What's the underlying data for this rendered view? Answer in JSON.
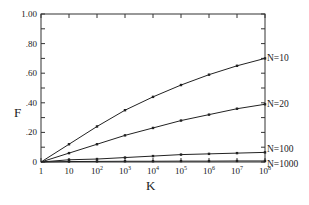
{
  "chart_data": {
    "type": "line",
    "title": "",
    "xlabel": "K",
    "ylabel": "F",
    "x_scale": "log",
    "x": [
      1,
      10,
      100,
      1000,
      10000,
      100000,
      1000000,
      10000000,
      100000000
    ],
    "x_tick_labels": [
      {
        "base": "1",
        "exp": ""
      },
      {
        "base": "10",
        "exp": ""
      },
      {
        "base": "10",
        "exp": "2"
      },
      {
        "base": "10",
        "exp": "3"
      },
      {
        "base": "10",
        "exp": "4"
      },
      {
        "base": "10",
        "exp": "5"
      },
      {
        "base": "10",
        "exp": "6"
      },
      {
        "base": "10",
        "exp": "7"
      },
      {
        "base": "10",
        "exp": "8"
      }
    ],
    "ylim": [
      0,
      1.0
    ],
    "y_ticks": [
      0,
      0.2,
      0.4,
      0.6,
      0.8,
      1.0
    ],
    "y_tick_labels": [
      "0",
      ".20",
      ".40",
      ".60",
      ".80",
      "1.00"
    ],
    "y_minor_step": 0.1,
    "grid": false,
    "legend": "inline-right",
    "series": [
      {
        "name": "N=10",
        "values": [
          0,
          0.12,
          0.24,
          0.35,
          0.44,
          0.52,
          0.59,
          0.65,
          0.7
        ]
      },
      {
        "name": "N=20",
        "values": [
          0,
          0.06,
          0.12,
          0.18,
          0.23,
          0.28,
          0.32,
          0.36,
          0.39
        ]
      },
      {
        "name": "N=100",
        "values": [
          0,
          0.015,
          0.02,
          0.03,
          0.04,
          0.05,
          0.055,
          0.06,
          0.065
        ]
      },
      {
        "name": "N=1000",
        "values": [
          0,
          0.003,
          0.004,
          0.005,
          0.005,
          0.006,
          0.006,
          0.007,
          0.007
        ]
      }
    ]
  }
}
